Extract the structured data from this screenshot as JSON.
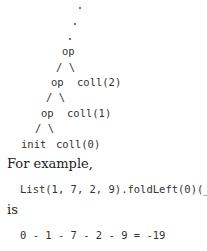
{
  "tree": {
    "dots": [
      ".",
      ".",
      "."
    ],
    "level3": {
      "op": "op",
      "branch": "/ \\",
      "right": "coll(2)"
    },
    "level2": {
      "op": "op",
      "branch": "/ \\",
      "right": "coll(1)"
    },
    "level1": {
      "op": "op",
      "branch": "/ \\",
      "left": "init",
      "right": "coll(0)"
    }
  },
  "text": {
    "for_example": "For example,",
    "code": "List(1, 7, 2, 9).foldLeft(0)(_ - _)",
    "is": "is",
    "result": "0 - 1 - 7 - 2 - 9 = -19"
  }
}
